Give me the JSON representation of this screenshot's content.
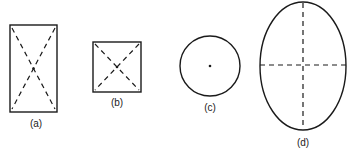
{
  "figures": [
    {
      "id": "a",
      "label": "(a)",
      "shape": "rectangle",
      "diagonals": "dashed",
      "center_dot": true
    },
    {
      "id": "b",
      "label": "(b)",
      "shape": "square",
      "diagonals": "dashed",
      "center_dot": true
    },
    {
      "id": "c",
      "label": "(c)",
      "shape": "circle",
      "center_dot": true
    },
    {
      "id": "d",
      "label": "(d)",
      "shape": "ellipse",
      "axes": "dashed"
    }
  ]
}
